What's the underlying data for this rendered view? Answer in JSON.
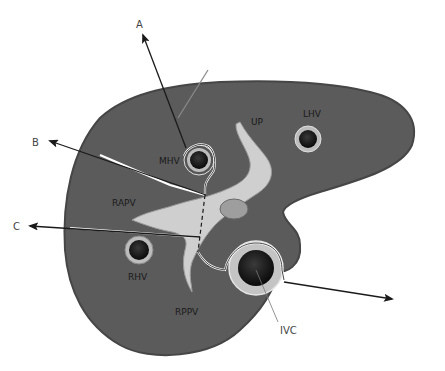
{
  "colors": {
    "parenchyma": "#5b5b5b",
    "parenchyma_edge": "#4a4a4a",
    "portal_vein": "#cfcfcf",
    "vessel_ring": "#bdbdbd",
    "vessel_lumen": "#111111",
    "background": "#ffffff",
    "arrow": "#1a1a1a"
  },
  "labels": {
    "structures": {
      "mhv": "MHV",
      "lhv": "LHV",
      "rhv": "RHV",
      "up": "UP",
      "rapv": "RAPV",
      "rppv": "RPPV",
      "ivc": "IVC"
    },
    "planes": {
      "a": "A",
      "b": "B",
      "c": "C"
    }
  }
}
